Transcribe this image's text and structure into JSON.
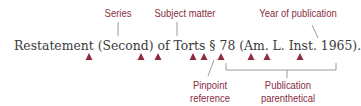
{
  "citation": {
    "text": "Restatement (Second) of Torts § 78 (Am. L. Inst. 1965)."
  },
  "labels": {
    "series": "Series",
    "subject_matter": "Subject matter",
    "year_of_publication": "Year of publication",
    "pinpoint_line1": "Pinpoint",
    "pinpoint_line2": "reference",
    "parenthetical_line1": "Publication",
    "parenthetical_line2": "parenthetical"
  },
  "space_markers": {
    "count": 9,
    "meaning": "space",
    "color": "#8a2d3f"
  },
  "colors": {
    "accent": "#8a2d3f",
    "text": "#3a3a3a",
    "leader_line": "#9a9a9a",
    "background": "#ffffff"
  }
}
